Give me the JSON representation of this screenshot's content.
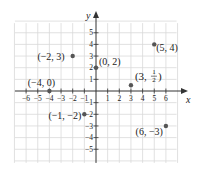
{
  "diagram": {
    "type": "coordinate-plane",
    "axes": {
      "x_label": "x",
      "y_label": "y"
    },
    "x_ticks": [
      -6,
      -5,
      -4,
      -3,
      -2,
      -1,
      1,
      2,
      3,
      4,
      5,
      6
    ],
    "y_ticks": [
      -5,
      -4,
      -3,
      -2,
      -1,
      1,
      2,
      3,
      4,
      5
    ],
    "x_tick_labels": [
      "−6",
      "−5",
      "−4",
      "−3",
      "−2",
      "−1",
      "1",
      "2",
      "3",
      "4",
      "5",
      "6"
    ],
    "y_tick_labels": [
      "−5",
      "−4",
      "−3",
      "−2",
      "−1",
      "1",
      "2",
      "3",
      "4",
      "5"
    ],
    "grid": {
      "xmin": -7,
      "xmax": 7,
      "ymin": -6,
      "ymax": 6
    },
    "points": [
      {
        "x": -2,
        "y": 3,
        "label": "(−2, 3)"
      },
      {
        "x": 0,
        "y": 2,
        "label": "(0, 2)"
      },
      {
        "x": 5,
        "y": 4,
        "label": "(5, 4)"
      },
      {
        "x": -4,
        "y": 0,
        "label": "(−4, 0)"
      },
      {
        "x": 3,
        "y": 0.5,
        "label": "(3, 1/2)"
      },
      {
        "x": -1,
        "y": -2,
        "label": "(−1, −2)"
      },
      {
        "x": 6,
        "y": -3,
        "label": "(6, −3)"
      }
    ],
    "colors": {
      "grid": "#d9d9d9",
      "axis": "#333333",
      "point": "#555555",
      "text": "#222222"
    }
  }
}
